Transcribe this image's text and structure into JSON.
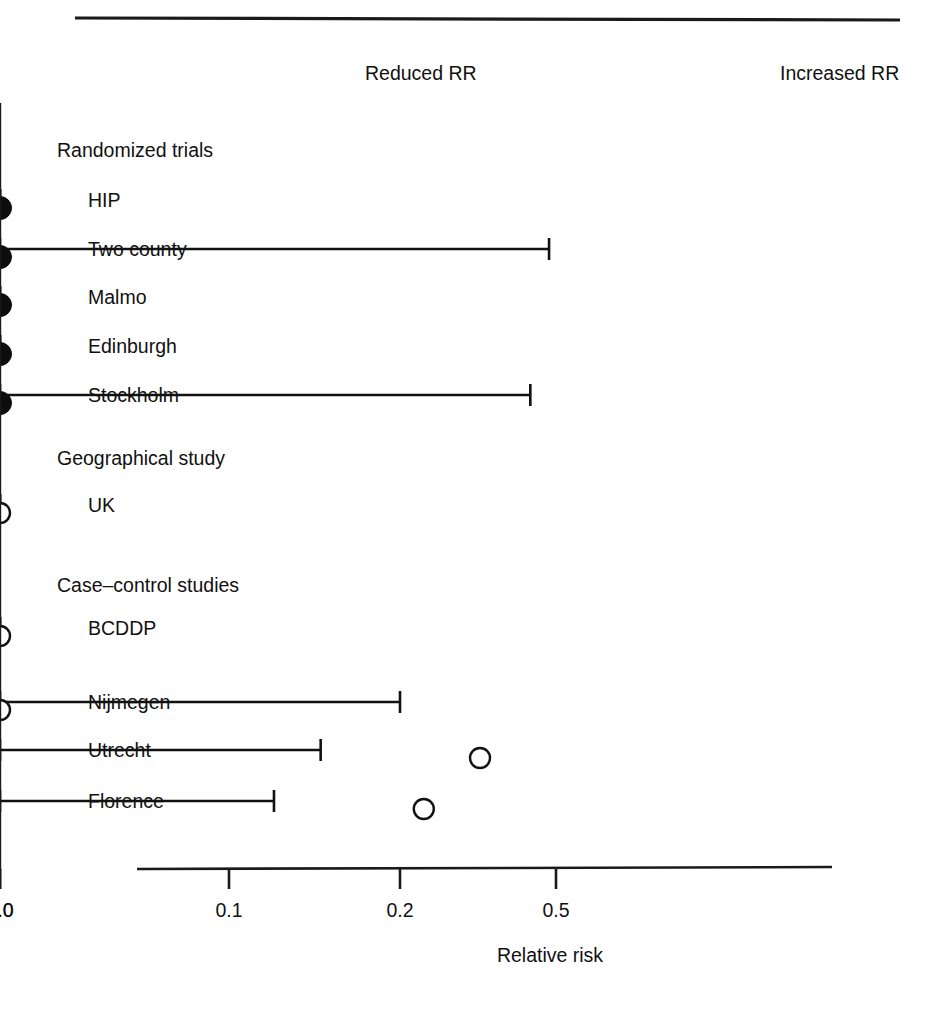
{
  "figure": {
    "top_rule": true,
    "direction_labels": {
      "left": "Reduced RR",
      "right": "Increased RR"
    },
    "axis_title": "Relative risk"
  },
  "chart_data": {
    "type": "scatter",
    "subtype": "forest-plot",
    "title": "",
    "xlabel": "Relative risk",
    "ylabel": "",
    "xscale": "log-approximate",
    "xticks": [
      0.1,
      0.2,
      0.5,
      1.0,
      2.0
    ],
    "xtick_labels": [
      "0.1",
      "0.2",
      "0.5",
      "1.0",
      "2.0"
    ],
    "xlim": [
      0.08,
      2.6
    ],
    "reference_line": 1.0,
    "grid": false,
    "legend": "none",
    "annotations": [
      "Reduced RR",
      "Increased RR"
    ],
    "marker_legend": {
      "filled": "randomized trial",
      "open": "observational study"
    },
    "rows": [
      {
        "kind": "group",
        "label": "Randomized trials"
      },
      {
        "kind": "study",
        "label": "HIP",
        "marker": "filled",
        "estimate": 0.79,
        "ci_low": 0.6,
        "ci_high": 1.1
      },
      {
        "kind": "study",
        "label": "Two county",
        "marker": "filled",
        "estimate": 0.66,
        "ci_low": 0.48,
        "ci_high": 0.88
      },
      {
        "kind": "study",
        "label": "Malmo",
        "marker": "filled",
        "estimate": 0.78,
        "ci_low": 0.51,
        "ci_high": 1.25
      },
      {
        "kind": "study",
        "label": "Edinburgh",
        "marker": "filled",
        "estimate": 0.78,
        "ci_low": 0.62,
        "ci_high": 1.12
      },
      {
        "kind": "study",
        "label": "Stockholm",
        "marker": "filled",
        "estimate": 0.66,
        "ci_low": 0.43,
        "ci_high": 1.04
      },
      {
        "kind": "group",
        "label": "Geographical study"
      },
      {
        "kind": "study",
        "label": "UK",
        "marker": "open",
        "estimate": 0.78,
        "ci_low": 0.68,
        "ci_high": 1.06
      },
      {
        "kind": "group",
        "label": "Case–control studies"
      },
      {
        "kind": "study",
        "label": "BCDDP",
        "marker": "open",
        "estimate": 0.78,
        "ci_low": 0.72,
        "ci_high": 0.92
      },
      {
        "kind": "study",
        "label": "Nijmegen",
        "marker": "open",
        "estimate": 0.55,
        "ci_low": 0.2,
        "ci_high": 0.9
      },
      {
        "kind": "study",
        "label": "Utrecht",
        "marker": "open",
        "estimate": 0.32,
        "ci_low": 0.145,
        "ci_high": 0.8
      },
      {
        "kind": "study",
        "label": "Florence",
        "marker": "open",
        "estimate": 0.23,
        "ci_low": 0.12,
        "ci_high": 0.7
      }
    ]
  },
  "geometry": {
    "tick_px": {
      "0.1": 229,
      "0.2": 400,
      "0.5": 556,
      "1.0": 669,
      "2.0": 792
    },
    "axis_y": 869,
    "axis_x0": 137,
    "axis_x1": 832,
    "ref_top": 103,
    "label_x_group": 57,
    "label_x_study": 88,
    "row_y": {
      "Randomized trials": 150,
      "HIP": 200,
      "Two county": 249,
      "Malmo": 297,
      "Edinburgh": 346,
      "Stockholm": 395,
      "Geographical study": 458,
      "UK": 505,
      "Case–control studies": 585,
      "BCDDP": 628,
      "Nijmegen": 702,
      "Utrecht": 750,
      "Florence": 801
    }
  }
}
